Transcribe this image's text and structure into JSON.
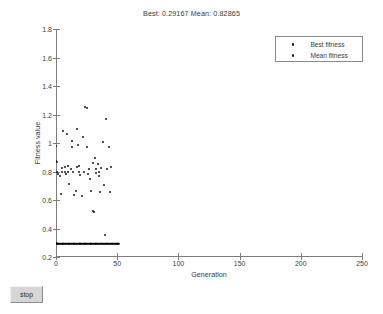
{
  "window": {
    "background_color": "#fefefe"
  },
  "controls": {
    "stop_label": "stop"
  },
  "chart_data": {
    "type": "scatter",
    "title": "Best: 0.29167 Mean: 0.82865",
    "best_value": 0.29167,
    "mean_value": 0.82865,
    "xlabel": "Generation",
    "ylabel": "Fitness value",
    "xlim": [
      0,
      250
    ],
    "ylim": [
      0.2,
      1.8
    ],
    "xticks": [
      0,
      50,
      100,
      150,
      200,
      250
    ],
    "yticks": [
      0.2,
      0.4,
      0.6,
      0.8,
      1,
      1.2,
      1.4,
      1.6,
      1.8
    ],
    "xtick_labels": [
      "0",
      "50",
      "100",
      "150",
      "200",
      "250"
    ],
    "ytick_labels": [
      "0.2",
      "0.4",
      "0.6",
      "0.8",
      "1",
      "1.2",
      "1.4",
      "1.6",
      "1.8"
    ],
    "grid": false,
    "legend_position": "top-right",
    "marker_color": "#1a1a1a",
    "series": [
      {
        "name": "Best fitness",
        "marker": "dot",
        "color": "#000000",
        "points": [
          [
            0,
            0.3
          ],
          [
            1,
            0.2917
          ],
          [
            2,
            0.2917
          ],
          [
            3,
            0.2917
          ],
          [
            4,
            0.2917
          ],
          [
            5,
            0.2917
          ],
          [
            6,
            0.2917
          ],
          [
            7,
            0.2917
          ],
          [
            8,
            0.2917
          ],
          [
            9,
            0.2917
          ],
          [
            10,
            0.2917
          ],
          [
            11,
            0.2917
          ],
          [
            12,
            0.2917
          ],
          [
            13,
            0.2917
          ],
          [
            14,
            0.2917
          ],
          [
            15,
            0.2917
          ],
          [
            16,
            0.2917
          ],
          [
            17,
            0.2917
          ],
          [
            18,
            0.2917
          ],
          [
            19,
            0.2917
          ],
          [
            20,
            0.2917
          ],
          [
            21,
            0.2917
          ],
          [
            22,
            0.2917
          ],
          [
            23,
            0.2917
          ],
          [
            24,
            0.2917
          ],
          [
            25,
            0.2917
          ],
          [
            26,
            0.2917
          ],
          [
            27,
            0.2917
          ],
          [
            28,
            0.2917
          ],
          [
            29,
            0.2917
          ],
          [
            30,
            0.2917
          ],
          [
            31,
            0.2917
          ],
          [
            32,
            0.2917
          ],
          [
            33,
            0.2917
          ],
          [
            34,
            0.2917
          ],
          [
            35,
            0.2917
          ],
          [
            36,
            0.2917
          ],
          [
            37,
            0.2917
          ],
          [
            38,
            0.2917
          ],
          [
            39,
            0.2917
          ],
          [
            40,
            0.2917
          ],
          [
            41,
            0.2917
          ],
          [
            42,
            0.2917
          ],
          [
            43,
            0.2917
          ],
          [
            44,
            0.2917
          ],
          [
            45,
            0.2917
          ],
          [
            46,
            0.2917
          ],
          [
            47,
            0.2917
          ],
          [
            48,
            0.2917
          ],
          [
            49,
            0.2917
          ],
          [
            50,
            0.2917
          ],
          [
            51,
            0.2917
          ]
        ]
      },
      {
        "name": "Mean fitness",
        "marker": "dot",
        "color": "#1a1a1a",
        "points": [
          [
            0,
            0.98
          ],
          [
            0,
            0.875
          ],
          [
            1,
            0.87
          ],
          [
            1,
            0.8
          ],
          [
            2,
            0.785
          ],
          [
            3,
            0.765
          ],
          [
            4,
            0.645
          ],
          [
            5,
            0.825
          ],
          [
            5,
            0.8
          ],
          [
            6,
            1.085
          ],
          [
            7,
            0.835
          ],
          [
            7,
            0.795
          ],
          [
            8,
            0.78
          ],
          [
            9,
            1.065
          ],
          [
            10,
            0.84
          ],
          [
            10,
            0.8
          ],
          [
            11,
            0.715
          ],
          [
            12,
            0.815
          ],
          [
            13,
            1.015
          ],
          [
            13,
            0.975
          ],
          [
            14,
            0.8
          ],
          [
            15,
            0.635
          ],
          [
            16,
            0.66
          ],
          [
            17,
            1.1
          ],
          [
            17,
            0.835
          ],
          [
            18,
            0.985
          ],
          [
            19,
            0.84
          ],
          [
            19,
            0.795
          ],
          [
            20,
            0.775
          ],
          [
            21,
            0.625
          ],
          [
            22,
            1.045
          ],
          [
            23,
            0.8
          ],
          [
            24,
            1.25
          ],
          [
            25,
            1.247
          ],
          [
            25,
            0.975
          ],
          [
            26,
            0.785
          ],
          [
            27,
            0.82
          ],
          [
            28,
            0.745
          ],
          [
            29,
            0.665
          ],
          [
            30,
            0.86
          ],
          [
            30,
            0.525
          ],
          [
            31,
            0.515
          ],
          [
            32,
            0.895
          ],
          [
            33,
            0.82
          ],
          [
            33,
            0.79
          ],
          [
            34,
            0.855
          ],
          [
            35,
            0.8
          ],
          [
            35,
            0.765
          ],
          [
            36,
            0.655
          ],
          [
            37,
            0.825
          ],
          [
            38,
            1.005
          ],
          [
            39,
            0.705
          ],
          [
            40,
            0.355
          ],
          [
            41,
            1.17
          ],
          [
            42,
            0.815
          ],
          [
            43,
            0.975
          ],
          [
            44,
            0.655
          ],
          [
            45,
            0.835
          ]
        ]
      }
    ]
  },
  "legend": {
    "items": [
      {
        "label": "Best fitness"
      },
      {
        "label": "Mean fitness"
      }
    ]
  }
}
